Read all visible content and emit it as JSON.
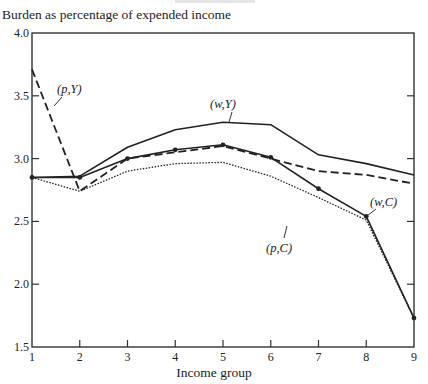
{
  "chart_data": {
    "type": "line",
    "title": "",
    "ylabel": "Burden as percentage of expended income",
    "xlabel": "Income group",
    "x": [
      1,
      2,
      3,
      4,
      5,
      6,
      7,
      8,
      9
    ],
    "xlim": [
      1,
      9
    ],
    "ylim": [
      1.5,
      4.0
    ],
    "xticks": [
      "1",
      "2",
      "3",
      "4",
      "5",
      "6",
      "7",
      "8",
      "9"
    ],
    "yticks": [
      "1.5",
      "2.0",
      "2.5",
      "3.0",
      "3.5",
      "4.0"
    ],
    "grid": false,
    "legend": "inline labels",
    "series": [
      {
        "name": "(w,Y)",
        "style": "solid",
        "markers": false,
        "values": [
          2.85,
          2.86,
          3.09,
          3.23,
          3.29,
          3.27,
          3.03,
          2.96,
          2.87
        ]
      },
      {
        "name": "(p,Y)",
        "style": "dashed",
        "markers": false,
        "values": [
          3.71,
          2.74,
          3.0,
          3.05,
          3.1,
          3.0,
          2.9,
          2.87,
          2.8
        ]
      },
      {
        "name": "(w,C)",
        "style": "solid",
        "markers": true,
        "values": [
          2.85,
          2.85,
          3.0,
          3.07,
          3.11,
          3.01,
          2.76,
          2.54,
          1.73
        ]
      },
      {
        "name": "(p,C)",
        "style": "dotted",
        "markers": false,
        "values": [
          2.85,
          2.74,
          2.9,
          2.96,
          2.97,
          2.86,
          2.69,
          2.51,
          1.73
        ]
      }
    ],
    "annotations": [
      {
        "text": "(p,Y)",
        "at_x": 1.6,
        "at_y": 3.45
      },
      {
        "text": "(w,Y)",
        "at_x": 5.0,
        "at_y": 3.42
      },
      {
        "text": "(p,C)",
        "at_x": 6.3,
        "at_y": 2.62
      },
      {
        "text": "(w,C)",
        "at_x": 8.3,
        "at_y": 2.62
      }
    ]
  },
  "labels": {
    "ylabel": "Burden as percentage of expended income",
    "xlabel": "Income group"
  }
}
